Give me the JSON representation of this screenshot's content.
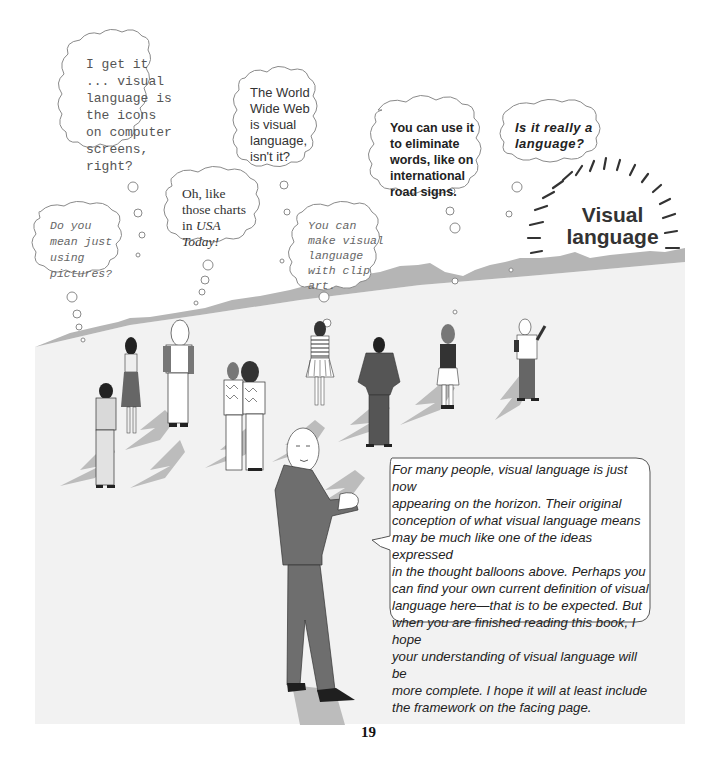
{
  "page": {
    "number": "19"
  },
  "title": {
    "line1": "Visual",
    "line2": "language"
  },
  "thought_balloons": [
    {
      "id": "icons",
      "font": "monospace",
      "lines": [
        "I get it",
        "... visual",
        "language is",
        "the icons",
        "on computer",
        "screens,",
        "right?"
      ]
    },
    {
      "id": "www",
      "font": "sans",
      "lines": [
        "The World",
        "Wide Web",
        "is visual",
        "language,",
        "isn't it?"
      ]
    },
    {
      "id": "road-signs",
      "font": "sans-bold",
      "lines": [
        "You can use it",
        "to eliminate",
        "words, like on",
        "international",
        "road signs."
      ]
    },
    {
      "id": "really-language",
      "font": "sans-bold-italic",
      "lines": [
        "Is it really a",
        "language?"
      ]
    },
    {
      "id": "pictures",
      "font": "monospace-italic",
      "lines": [
        "Do you",
        "mean just",
        "using",
        "pictures?"
      ]
    },
    {
      "id": "usa-today",
      "font": "serif",
      "lines": [
        "Oh, like",
        "those charts",
        "in"
      ],
      "italic_suffix": "USA",
      "italic_line": "Today!"
    },
    {
      "id": "clip-art",
      "font": "monospace-italic",
      "lines": [
        "You can",
        "make visual",
        "language",
        "with clip",
        "art."
      ]
    }
  ],
  "speech_balloon": {
    "lines": [
      "For many people, visual language is just now",
      "appearing on the horizon.  Their original",
      "conception of what visual language means",
      "may be much like one of the ideas expressed",
      "in the thought balloons above.  Perhaps you",
      "can find your own current definition of visual",
      "language here—that is to be expected.  But",
      "when you are finished reading this book, I hope",
      "your understanding of visual language will be",
      "more complete.  I hope it will at least include",
      "the framework on the facing page."
    ]
  },
  "figures": [
    {
      "name": "man-light-shirt"
    },
    {
      "name": "woman-dark-skirt"
    },
    {
      "name": "blonde-person-backpack"
    },
    {
      "name": "couple-patterned-sweaters"
    },
    {
      "name": "woman-striped-top"
    },
    {
      "name": "man-dark-suit-hands-on-hips"
    },
    {
      "name": "girl-with-binoculars"
    },
    {
      "name": "person-pointing"
    },
    {
      "name": "narrator-bald-man-suit"
    }
  ],
  "colors": {
    "ground": "#f1f1f1",
    "mountains": "#b3b3b3",
    "shadow": "#bcbcbc",
    "suit": "#6e6e6e",
    "dark": "#2a2a2a",
    "balloon_stroke": "#8a8a8a"
  }
}
